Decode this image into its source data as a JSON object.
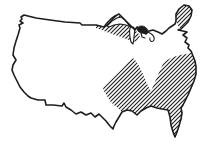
{
  "figure": {
    "type": "map-sketch",
    "regions": [
      {
        "id": "northeast-maine",
        "label": "Hatched area: Maine / far Northeast"
      },
      {
        "id": "great-lakes-band",
        "label": "Hatched band: Great Lakes / northern border"
      },
      {
        "id": "southeast-mass",
        "label": "Hatched area: south-central and southeastern states incl. Florida and Atlantic coast strip"
      }
    ],
    "colors": {
      "ink": "#1d1d1d",
      "background": "#ffffff"
    },
    "hatch": {
      "direction": "/",
      "angle_deg": 45,
      "spacing_px": 4,
      "line_width_px": 1.1
    },
    "paths": {
      "us_outline": "M24,15 L36,18 L50,20 L65,22 L80,23 L82,25 L96,25 L104,27 L107,23 L111,19 L115,16 L119,14 L122,17 L125,20 L129,24 L132,27 L135,30 L137,27 L140,29 L143,32 L146,34 L149,31 L153,30 L158,32 L162,34 L166,31 L169,28 L172,26 L175,24 L176,21 L176,14 L179,9 L184,5 L189,6 L192,10 L191,16 L188,22 L184,26 L181,29 L178,30 L183,31 L187,32 L183,35 L187,38 L185,42 L189,45 L188,48 L191,51 L193,56 L195,61 L196,67 L196,74 L194,81 L191,88 L188,95 L185,101 L183,105 L181,108 L182,113 L181,119 L179,126 L177,132 L175,137 L173,132 L171,125 L170,117 L168,110 L162,109 L157,108 L151,106 L146,108 L141,111 L137,115 L132,111 L127,110 L122,112 L119,117 L116,122 L114,126 L113,129 L110,126 L106,121 L102,117 L99,114 L95,117 L91,113 L86,115 L81,112 L76,114 L71,110 L66,107 L64,103 L62,106 L53,105 L46,105 L45,100 L38,100 L31,98 L28,96 L24,92 L20,87 L17,81 L14,75 L12,70 L13,65 L16,60 L13,55 L14,48 L16,41 L18,35 L20,28 L19,25 L23,23 L20,21 L22,19 L21,17 Z",
      "hatch_southeast": "M133,58 L136,61 L139,66 L142,72 L145,79 L148,86 L151,91 L154,84 L157,77 L160,70 L163,64 L167,60 L173,57 L180,55 L186,54 L191,53 L193,56 L195,61 L196,67 L196,74 L194,81 L191,88 L188,95 L185,101 L183,105 L181,108 L182,113 L181,119 L179,126 L177,132 L175,137 L173,132 L171,125 L170,117 L168,110 L162,109 L157,108 L151,106 L146,108 L141,111 L137,115 L132,111 L127,110 L122,112 L118,108 L114,105 L110,101 L107,96 L104,91 L103,88 L107,84 L111,80 L115,76 L119,72 L124,67 L128,62 Z",
      "hatch_north_band": "M96,24 L104,27 L107,23 L111,19 L115,16 L119,14 L122,17 L125,20 L129,24 L132,27 L135,30 L138,33 L140,36 L136,42 L129,40 L121,37 L112,34 L104,31 L96,28 Z",
      "hatch_maine": "M176,21 L176,14 L179,9 L184,5 L189,6 L192,10 L191,16 L188,22 L184,26 L181,29 L178,26 Z",
      "lake_superior": "M107,26 L112,21 L117,18 L121,17 L125,20 L128,24 L131,27 L126,25 L120,24 L114,25 L109,27 Z",
      "lake_michigan": "M130,28 C129,33 130,38 131,42 L133,44 C134,40 134,34 135,29 L133,27 Z",
      "lake_huron_blob": "M137,29 C138,26 142,25 145,27 C148,29 149,32 147,33 C144,34 141,33 139,32 C138,31 137,30 137,29 Z",
      "huron_hook": "M141,33 L142,37 L145,38",
      "erie_ontario_loop": "M148,32 C152,34 155,37 154,40 C152,43 149,41 150,38",
      "hatch_tile": "M-1,1 L1,-1 M0,4 L4,0 M3,5 L5,3"
    }
  }
}
